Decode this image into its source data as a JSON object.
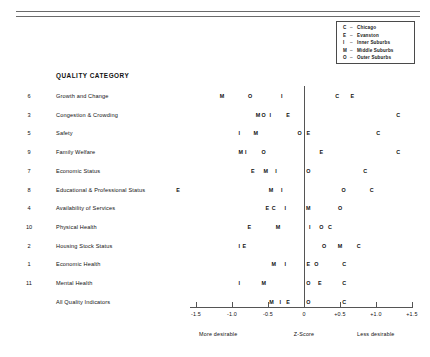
{
  "legend": {
    "items": [
      {
        "key": "C",
        "dash": "–",
        "name": "Chicago"
      },
      {
        "key": "E",
        "dash": "–",
        "name": "Evanston"
      },
      {
        "key": "I",
        "dash": "–",
        "name": "Inner Suburbs"
      },
      {
        "key": "M",
        "dash": "–",
        "name": "Middle Suburbs"
      },
      {
        "key": "O",
        "dash": "–",
        "name": "Outer Suburbs"
      }
    ]
  },
  "heading": "QUALITY CATEGORY",
  "footer": {
    "more_desirable": "More desirable",
    "less_desirable": "Less desirable",
    "axis_title": "Z-Score"
  },
  "chart_data": {
    "type": "scatter",
    "title": "QUALITY CATEGORY",
    "xlabel": "Z-Score",
    "ylabel": "",
    "xlim": [
      -1.9,
      1.6
    ],
    "grid": false,
    "legend_position": "top-right",
    "xticks": [
      -1.5,
      -1.0,
      -0.5,
      0,
      0.5,
      1.0,
      1.5
    ],
    "xticklabels": [
      "-1.5",
      "-1.0",
      "-0.5",
      "0",
      "+0.5",
      "+1.0",
      "+1.5"
    ],
    "annotations": [
      "More desirable",
      "Z-Score",
      "Less desirable"
    ],
    "series": [
      {
        "name": "Chicago",
        "marker": "C"
      },
      {
        "name": "Evanston",
        "marker": "E"
      },
      {
        "name": "Inner Suburbs",
        "marker": "I"
      },
      {
        "name": "Middle Suburbs",
        "marker": "M"
      },
      {
        "name": "Outer Suburbs",
        "marker": "O"
      }
    ],
    "rows": [
      {
        "rank": "6",
        "category": "Growth and Change",
        "points": [
          {
            "m": "M",
            "v": -1.14
          },
          {
            "m": "O",
            "v": -0.75
          },
          {
            "m": "I",
            "v": -0.31
          },
          {
            "m": "C",
            "v": 0.46
          },
          {
            "m": "E",
            "v": 0.67
          }
        ]
      },
      {
        "rank": "3",
        "category": "Congestion & Crowding",
        "points": [
          {
            "m": "M",
            "v": -0.64
          },
          {
            "m": "O",
            "v": -0.56
          },
          {
            "m": "I",
            "v": -0.47
          },
          {
            "m": "E",
            "v": -0.22
          },
          {
            "m": "C",
            "v": 1.31
          }
        ]
      },
      {
        "rank": "5",
        "category": "Safety",
        "points": [
          {
            "m": "I",
            "v": -0.9
          },
          {
            "m": "M",
            "v": -0.67
          },
          {
            "m": "O",
            "v": -0.06
          },
          {
            "m": "E",
            "v": 0.06
          },
          {
            "m": "C",
            "v": 1.03
          }
        ]
      },
      {
        "rank": "9",
        "category": "Family Welfare",
        "points": [
          {
            "m": "M",
            "v": -0.88
          },
          {
            "m": "I",
            "v": -0.81
          },
          {
            "m": "O",
            "v": -0.56
          },
          {
            "m": "E",
            "v": 0.24
          },
          {
            "m": "C",
            "v": 1.31
          }
        ]
      },
      {
        "rank": "7",
        "category": "Economic Status",
        "points": [
          {
            "m": "E",
            "v": -0.71
          },
          {
            "m": "M",
            "v": -0.53
          },
          {
            "m": "I",
            "v": -0.39
          },
          {
            "m": "O",
            "v": 0.06
          },
          {
            "m": "C",
            "v": 0.85
          }
        ]
      },
      {
        "rank": "8",
        "category": "Educational & Professional Status",
        "points": [
          {
            "m": "E",
            "v": -1.75
          },
          {
            "m": "M",
            "v": -0.46
          },
          {
            "m": "I",
            "v": -0.31
          },
          {
            "m": "O",
            "v": 0.55
          },
          {
            "m": "C",
            "v": 0.94
          }
        ]
      },
      {
        "rank": "4",
        "category": "Availability of Services",
        "points": [
          {
            "m": "E",
            "v": -0.51
          },
          {
            "m": "C",
            "v": -0.42
          },
          {
            "m": "I",
            "v": -0.26
          },
          {
            "m": "M",
            "v": 0.06
          },
          {
            "m": "O",
            "v": 0.5
          }
        ]
      },
      {
        "rank": "10",
        "category": "Physical Health",
        "points": [
          {
            "m": "E",
            "v": -0.76
          },
          {
            "m": "M",
            "v": -0.36
          },
          {
            "m": "I",
            "v": 0.08
          },
          {
            "m": "O",
            "v": 0.24
          },
          {
            "m": "C",
            "v": 0.36
          }
        ]
      },
      {
        "rank": "2",
        "category": "Housing Stock Status",
        "points": [
          {
            "m": "I",
            "v": -0.9
          },
          {
            "m": "E",
            "v": -0.83
          },
          {
            "m": "O",
            "v": 0.28
          },
          {
            "m": "M",
            "v": 0.5
          },
          {
            "m": "C",
            "v": 0.76
          }
        ]
      },
      {
        "rank": "1",
        "category": "Economic Health",
        "points": [
          {
            "m": "M",
            "v": -0.42
          },
          {
            "m": "I",
            "v": -0.26
          },
          {
            "m": "E",
            "v": 0.06
          },
          {
            "m": "O",
            "v": 0.17
          },
          {
            "m": "C",
            "v": 0.56
          }
        ]
      },
      {
        "rank": "11",
        "category": "Mental Health",
        "points": [
          {
            "m": "I",
            "v": -0.9
          },
          {
            "m": "M",
            "v": -0.56
          },
          {
            "m": "O",
            "v": 0.06
          },
          {
            "m": "E",
            "v": 0.22
          },
          {
            "m": "C",
            "v": 0.56
          }
        ]
      },
      {
        "rank": "",
        "category": "All Quality Indicators",
        "points": [
          {
            "m": "M",
            "v": -0.45
          },
          {
            "m": "I",
            "v": -0.33
          },
          {
            "m": "E",
            "v": -0.22
          },
          {
            "m": "O",
            "v": 0.06
          },
          {
            "m": "C",
            "v": 0.56
          }
        ]
      }
    ]
  }
}
